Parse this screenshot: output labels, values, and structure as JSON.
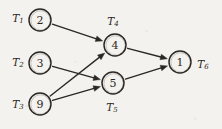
{
  "diagram": {
    "type": "directed-task-graph",
    "background_color": "#f4f2ee",
    "ink_color": "#2b2824",
    "nodes": [
      {
        "id": "n2",
        "value": "2",
        "task_label": "T",
        "task_index": "1",
        "cx": 40,
        "cy": 20,
        "r": 11,
        "label_position": "left",
        "label_x": 18,
        "label_y": 18
      },
      {
        "id": "n3",
        "value": "3",
        "task_label": "T",
        "task_index": "2",
        "cx": 40,
        "cy": 63,
        "r": 11,
        "label_position": "left",
        "label_x": 18,
        "label_y": 62
      },
      {
        "id": "n9",
        "value": "9",
        "task_label": "T",
        "task_index": "3",
        "cx": 40,
        "cy": 104,
        "r": 11,
        "label_position": "left",
        "label_x": 18,
        "label_y": 104
      },
      {
        "id": "n4",
        "value": "4",
        "task_label": "T",
        "task_index": "4",
        "cx": 115,
        "cy": 45,
        "r": 11,
        "label_position": "above",
        "label_x": 113,
        "label_y": 21
      },
      {
        "id": "n5",
        "value": "5",
        "task_label": "T",
        "task_index": "5",
        "cx": 113,
        "cy": 83,
        "r": 11,
        "label_position": "below",
        "label_x": 112,
        "label_y": 107
      },
      {
        "id": "n1",
        "value": "1",
        "task_label": "T",
        "task_index": "6",
        "cx": 180,
        "cy": 62,
        "r": 11,
        "label_position": "right",
        "label_x": 203,
        "label_y": 64
      }
    ],
    "edges": [
      {
        "id": "e1",
        "from": "n2",
        "to": "n4",
        "name": "edge-2-to-4"
      },
      {
        "id": "e2",
        "from": "n3",
        "to": "n5",
        "name": "edge-3-to-5"
      },
      {
        "id": "e3",
        "from": "n9",
        "to": "n4",
        "name": "edge-9-to-4"
      },
      {
        "id": "e4",
        "from": "n9",
        "to": "n5",
        "name": "edge-9-to-5"
      },
      {
        "id": "e5",
        "from": "n4",
        "to": "n1",
        "name": "edge-4-to-1"
      },
      {
        "id": "e6",
        "from": "n5",
        "to": "n1",
        "name": "edge-5-to-1"
      }
    ]
  }
}
